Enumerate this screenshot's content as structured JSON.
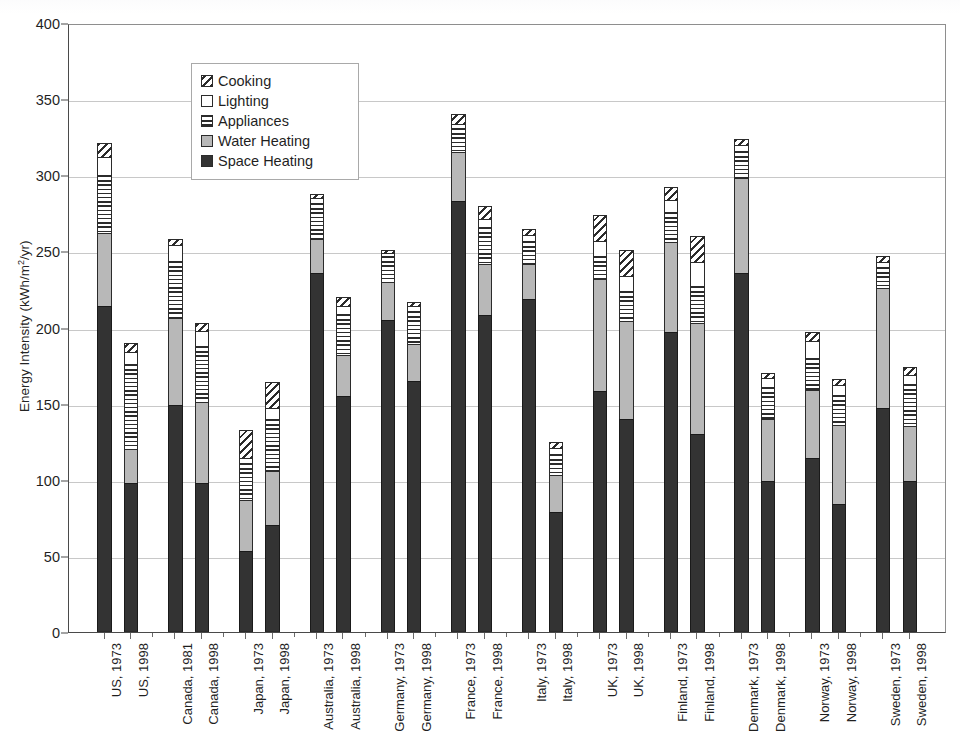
{
  "chart_data": {
    "type": "bar",
    "subtype": "stacked-vertical",
    "title": "",
    "xlabel": "",
    "ylabel": "Energy Intensity (kWh/m2/yr)",
    "ylabel_parts": {
      "pre": "Energy Intensity (kWh/m",
      "sup": "2",
      "post": "/yr)"
    },
    "ylim": [
      0,
      400
    ],
    "ytick_step": 50,
    "yticks": [
      0,
      50,
      100,
      150,
      200,
      250,
      300,
      350,
      400
    ],
    "grid": "horizontal",
    "legend_position": "top-left-inside",
    "legend": [
      "Cooking",
      "Lighting",
      "Appliances",
      "Water Heating",
      "Space Heating"
    ],
    "stack_order_bottom_to_top": [
      "Space Heating",
      "Water Heating",
      "Appliances",
      "Lighting",
      "Cooking"
    ],
    "categories": [
      "US, 1973",
      "US, 1998",
      "Canada, 1981",
      "Canada, 1998",
      "Japan, 1973",
      "Japan, 1998",
      "Australia, 1973",
      "Australia, 1998",
      "Germany, 1973",
      "Germany, 1998",
      "France, 1973",
      "France, 1998",
      "Italy, 1973",
      "Italy, 1998",
      "UK, 1973",
      "UK, 1998",
      "Finland, 1973",
      "Finland, 1998",
      "Denmark, 1973",
      "Denmark, 1998",
      "Norway, 1973",
      "Norway, 1998",
      "Sweden, 1973",
      "Sweden, 1998"
    ],
    "group_gaps_after": [
      1,
      3,
      5,
      7,
      9,
      11,
      13,
      15,
      17,
      19,
      21
    ],
    "series": [
      {
        "name": "Space Heating",
        "values": [
          214,
          98,
          149,
          98,
          53,
          70,
          236,
          155,
          205,
          165,
          283,
          208,
          219,
          79,
          158,
          140,
          197,
          130,
          236,
          99,
          114,
          84,
          147,
          99
        ]
      },
      {
        "name": "Water Heating",
        "values": [
          48,
          22,
          57,
          53,
          34,
          36,
          22,
          27,
          25,
          24,
          32,
          34,
          23,
          24,
          74,
          64,
          59,
          73,
          62,
          41,
          45,
          52,
          79,
          36
        ]
      },
      {
        "name": "Appliances",
        "values": [
          38,
          56,
          38,
          37,
          24,
          34,
          24,
          27,
          17,
          22,
          16,
          24,
          15,
          14,
          15,
          20,
          20,
          24,
          18,
          21,
          21,
          20,
          14,
          28
        ]
      },
      {
        "name": "Lighting",
        "values": [
          12,
          8,
          10,
          10,
          3,
          7,
          3,
          5,
          2,
          3,
          3,
          5,
          4,
          4,
          10,
          10,
          8,
          16,
          4,
          6,
          11,
          6,
          3,
          6
        ]
      },
      {
        "name": "Cooking",
        "values": [
          9,
          6,
          4,
          5,
          19,
          17,
          3,
          6,
          2,
          3,
          6,
          9,
          4,
          4,
          17,
          17,
          8,
          17,
          4,
          3,
          6,
          4,
          4,
          5
        ]
      }
    ],
    "totals": [
      321,
      190,
      258,
      203,
      133,
      164,
      288,
      220,
      251,
      217,
      340,
      280,
      265,
      125,
      274,
      251,
      292,
      260,
      324,
      170,
      197,
      166,
      247,
      174
    ]
  },
  "style": {
    "space_heating_color": "#333333",
    "water_heating_color": "#b8b8b8",
    "lighting_color": "#ffffff",
    "outline_color": "#2b2b2b",
    "grid_color": "#c8c8c8",
    "axis_color": "#4a4a4a",
    "background": "#ffffff"
  }
}
